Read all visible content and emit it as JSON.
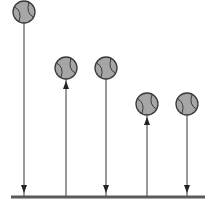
{
  "diagram": {
    "title": "",
    "colors": {
      "ball_fill": "#a6a6a6",
      "ball_stroke": "#3a3a3a",
      "seam": "#3a3a3a",
      "arrow": "#555555",
      "ground": "#5a5a5a",
      "background": "#ffffff"
    },
    "ground": {
      "x1": 11,
      "x2": 205,
      "y": 197,
      "thickness": 3
    },
    "balls": [
      {
        "id": "ball-1",
        "cx": 24,
        "cy": 12,
        "r": 11,
        "arrow_direction": "down"
      },
      {
        "id": "ball-2",
        "cx": 66,
        "cy": 68,
        "r": 11,
        "arrow_direction": "up"
      },
      {
        "id": "ball-3",
        "cx": 106,
        "cy": 68,
        "r": 11,
        "arrow_direction": "down"
      },
      {
        "id": "ball-4",
        "cx": 147,
        "cy": 104,
        "r": 11,
        "arrow_direction": "up"
      },
      {
        "id": "ball-5",
        "cx": 187,
        "cy": 104,
        "r": 11,
        "arrow_direction": "down"
      }
    ]
  }
}
